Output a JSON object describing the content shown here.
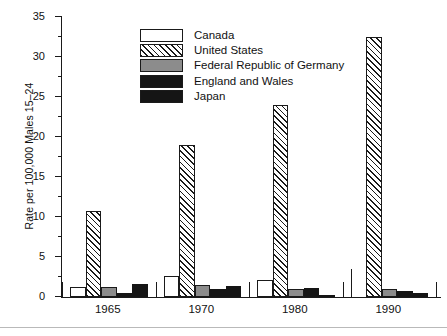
{
  "chart_data": {
    "type": "bar",
    "title": "",
    "xlabel": "",
    "ylabel": "Rate per 100,000 Males 15–24",
    "categories": [
      "1965",
      "1970",
      "1980",
      "1990"
    ],
    "ylim": [
      0,
      35
    ],
    "yticks": [
      0,
      5,
      10,
      15,
      20,
      25,
      30,
      35
    ],
    "ytick_labels": [
      "0",
      "5",
      "10",
      "15",
      "20",
      "25",
      "30",
      "35"
    ],
    "minor_tick_step": 2.5,
    "grid": false,
    "legend_position": "upper-left-inside",
    "series": [
      {
        "name": "Canada",
        "fill": "white",
        "values": [
          1.3,
          2.6,
          2.1,
          3.5
        ]
      },
      {
        "name": "United States",
        "fill": "diagonal-hatch",
        "values": [
          10.7,
          19.0,
          24.0,
          32.5
        ]
      },
      {
        "name": "Federal Republic of Germany",
        "fill": "gray",
        "values": [
          1.2,
          1.5,
          0.95,
          1.05
        ]
      },
      {
        "name": "England and Wales",
        "fill": "black",
        "values": [
          0.5,
          1.0,
          1.1,
          0.8
        ]
      },
      {
        "name": "Japan",
        "fill": "black",
        "values": [
          1.6,
          1.4,
          0.3,
          0.45
        ]
      }
    ]
  },
  "legend": {
    "items": [
      {
        "label": "Canada",
        "swatch": "white-swatch"
      },
      {
        "label": "United States",
        "swatch": "hatched-swatch"
      },
      {
        "label": "Federal Republic of Germany",
        "swatch": "gray-swatch"
      },
      {
        "label": "England and Wales",
        "swatch": "black-swatch"
      },
      {
        "label": "Japan",
        "swatch": "black-swatch"
      }
    ]
  },
  "colors": {
    "axis": "#1a1a1a",
    "white_fill": "#ffffff",
    "gray_fill": "#8c8c8c",
    "black_fill": "#151515",
    "hatch_stroke": "#1a1a1a",
    "footer_rule": "#b9b9b9"
  }
}
